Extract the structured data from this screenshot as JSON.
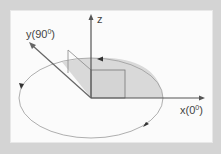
{
  "diagram": {
    "type": "3d-coordinate-axes-with-rotation",
    "axes": {
      "z": {
        "label": "z"
      },
      "y": {
        "label_main": "y(90",
        "label_sup": "0",
        "label_end": ")"
      },
      "x": {
        "label_main": "x(0",
        "label_sup": "0",
        "label_end": ")"
      }
    },
    "elements": [
      "ellipse-orbit-in-xy-plane",
      "shaded-quarter-sector",
      "rectangle-in-xz-plane",
      "parallelogram-in-yz-plane",
      "direction-arrowheads-counterclockwise"
    ],
    "colors": {
      "background": "#d4d4d4",
      "panel": "#fbfbfb",
      "axis": "#555555",
      "shade": "#d9d9d9",
      "orbit": "#8a8a8a"
    }
  }
}
